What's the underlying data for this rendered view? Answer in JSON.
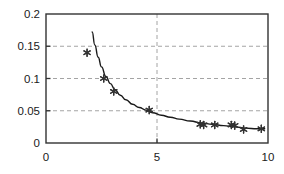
{
  "chart_data": {
    "type": "scatter",
    "title": "",
    "xlabel": "",
    "ylabel": "",
    "xlim": [
      0,
      10
    ],
    "ylim": [
      0,
      0.2
    ],
    "grid": true,
    "legend": "none",
    "xticks": [
      0,
      5,
      10
    ],
    "xtick_labels": [
      "0",
      "5",
      "10"
    ],
    "yticks": [
      0,
      0.05,
      0.1,
      0.15,
      0.2
    ],
    "ytick_labels": [
      "0",
      "0.05",
      "0.1",
      "0.15",
      "0.2"
    ],
    "gridlines_x": [
      5
    ],
    "gridlines_y": [
      0.05,
      0.1,
      0.15
    ],
    "marker": "asterisk",
    "marker_color": "#333333",
    "line_color": "#1a1a1a",
    "axis_color": "#333333",
    "grid_color": "#9a9a9a",
    "background": "#ffffff",
    "series": [
      {
        "name": "data points",
        "type": "scatter",
        "x": [
          1.85,
          2.6,
          3.05,
          4.65,
          6.95,
          7.1,
          7.6,
          8.35,
          8.5,
          8.9,
          9.7
        ],
        "y": [
          0.14,
          0.1,
          0.08,
          0.051,
          0.029,
          0.028,
          0.028,
          0.028,
          0.027,
          0.021,
          0.022
        ]
      },
      {
        "name": "fitted curve",
        "type": "line",
        "x": [
          2.08,
          2.2,
          2.35,
          2.5,
          2.7,
          2.9,
          3.1,
          3.35,
          3.6,
          3.9,
          4.2,
          4.5,
          4.8,
          5.2,
          5.6,
          6.0,
          6.5,
          7.0,
          7.5,
          8.0,
          8.5,
          9.0,
          9.5,
          9.85
        ],
        "y": [
          0.172,
          0.152,
          0.133,
          0.118,
          0.103,
          0.092,
          0.083,
          0.074,
          0.067,
          0.06,
          0.055,
          0.051,
          0.047,
          0.043,
          0.04,
          0.037,
          0.034,
          0.031,
          0.029,
          0.027,
          0.025,
          0.023,
          0.022,
          0.022
        ]
      }
    ]
  }
}
